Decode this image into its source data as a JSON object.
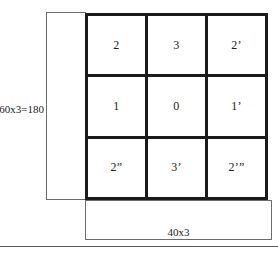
{
  "figure": {
    "height_annotation": {
      "label": "60x3=180"
    },
    "width_annotation": {
      "label": "40x3"
    },
    "grid": {
      "rows": 3,
      "columns": 3,
      "cells": [
        {
          "label": "2"
        },
        {
          "label": "3"
        },
        {
          "label": "2’"
        },
        {
          "label": "1"
        },
        {
          "label": "0"
        },
        {
          "label": "1’"
        },
        {
          "label": "2”"
        },
        {
          "label": "3’"
        },
        {
          "label": "2’”"
        }
      ]
    },
    "colors": {
      "grid_stroke": "#1b1b1b",
      "annotation_stroke": "#6b6b6b",
      "text": "#232323",
      "background": "#ffffff",
      "footer_rule": "#5a5a5a"
    }
  }
}
